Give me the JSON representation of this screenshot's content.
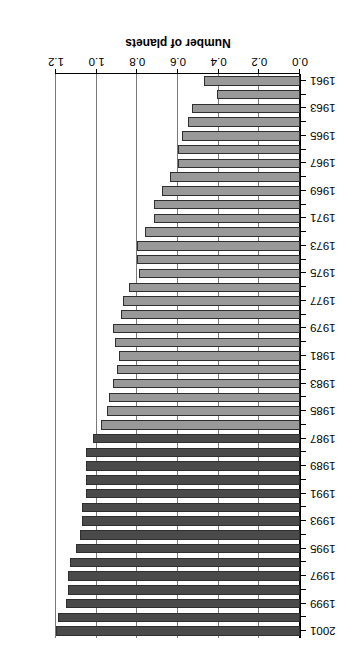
{
  "chart_data": {
    "type": "bar",
    "orientation": "horizontal",
    "title": "",
    "subtitle": "",
    "xlabel": "Number of planets",
    "ylabel": "",
    "xlim": [
      0.0,
      1.2
    ],
    "grid": true,
    "legend": null,
    "rotation_degrees": 180,
    "xticks": [
      0.0,
      0.2,
      0.4,
      0.6,
      0.8,
      1.0,
      1.2
    ],
    "xtick_labels": [
      "0.0",
      "0.2",
      "0.4",
      "0.6",
      "0.8",
      "1.0",
      "1.2"
    ],
    "categories": [
      "1961",
      "1962",
      "1963",
      "1964",
      "1965",
      "1966",
      "1967",
      "1968",
      "1969",
      "1970",
      "1971",
      "1972",
      "1973",
      "1974",
      "1975",
      "1976",
      "1977",
      "1978",
      "1979",
      "1980",
      "1981",
      "1982",
      "1983",
      "1984",
      "1985",
      "1986",
      "1987",
      "1988",
      "1989",
      "1990",
      "1991",
      "1992",
      "1993",
      "1994",
      "1995",
      "1996",
      "1997",
      "1998",
      "1999",
      "2000",
      "2001"
    ],
    "ytick_labels": [
      "1961",
      "1963",
      "1965",
      "1967",
      "1969",
      "1971",
      "1973",
      "1975",
      "1977",
      "1979",
      "1981",
      "1983",
      "1985",
      "1987",
      "1989",
      "1991",
      "1993",
      "1995",
      "1997",
      "1999",
      "2001"
    ],
    "values": [
      0.47,
      0.41,
      0.53,
      0.55,
      0.58,
      0.6,
      0.6,
      0.64,
      0.68,
      0.72,
      0.72,
      0.76,
      0.8,
      0.8,
      0.79,
      0.84,
      0.87,
      0.88,
      0.92,
      0.91,
      0.89,
      0.9,
      0.92,
      0.94,
      0.95,
      0.98,
      1.02,
      1.05,
      1.05,
      1.05,
      1.05,
      1.07,
      1.07,
      1.08,
      1.1,
      1.13,
      1.14,
      1.14,
      1.15,
      1.19,
      1.2
    ],
    "bar_colors": [
      "#999999",
      "#999999",
      "#999999",
      "#999999",
      "#999999",
      "#999999",
      "#999999",
      "#999999",
      "#999999",
      "#999999",
      "#999999",
      "#999999",
      "#999999",
      "#999999",
      "#999999",
      "#999999",
      "#999999",
      "#999999",
      "#999999",
      "#999999",
      "#999999",
      "#999999",
      "#999999",
      "#999999",
      "#999999",
      "#999999",
      "#4a4a4a",
      "#4a4a4a",
      "#4a4a4a",
      "#4a4a4a",
      "#4a4a4a",
      "#4a4a4a",
      "#4a4a4a",
      "#4a4a4a",
      "#4a4a4a",
      "#4a4a4a",
      "#4a4a4a",
      "#4a4a4a",
      "#4a4a4a",
      "#4a4a4a",
      "#4a4a4a"
    ],
    "colors": {
      "bar_light": "#999999",
      "bar_dark": "#4a4a4a",
      "bar_edge": "#2f2f2f",
      "gridline": "#7a7a7a",
      "axis": "#000000",
      "background": "#ffffff"
    }
  }
}
